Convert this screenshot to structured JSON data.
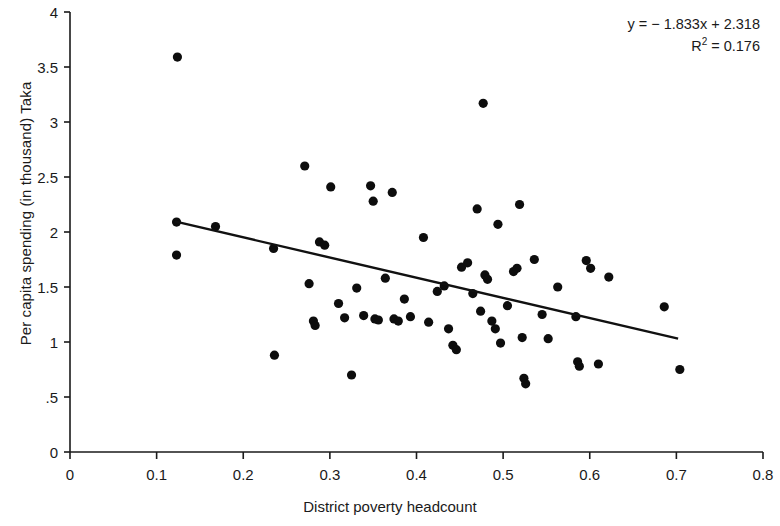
{
  "figure": {
    "background_color": "#ffffff",
    "foreground_color": "#1a1a1a",
    "marker_color": "#0d0d0d",
    "line_color": "#111111"
  },
  "annotation": {
    "equation_prefix": "y = − 1.833x + 2.318",
    "r_squared_label": "R",
    "r_squared_sup": "2",
    "r_squared_value": " = 0.176"
  },
  "chart_data": {
    "type": "scatter",
    "title": "",
    "xlabel": "District poverty headcount",
    "ylabel": "Per capita spending (in thousand) Taka",
    "xlim": [
      0,
      0.8
    ],
    "ylim": [
      0,
      4
    ],
    "grid": false,
    "legend": null,
    "xticks": [
      0,
      0.1,
      0.2,
      0.3,
      0.4,
      0.5,
      0.6,
      0.7,
      0.8
    ],
    "xtick_labels": [
      "0",
      "0.1",
      "0.2",
      "0.3",
      "0.4",
      "0.5",
      "0.6",
      "0.7",
      "0.8"
    ],
    "yticks": [
      0,
      0.5,
      1,
      1.5,
      2,
      2.5,
      3,
      3.5,
      4
    ],
    "ytick_labels": [
      "0",
      ".5",
      "1",
      "1.5",
      "2",
      "2.5",
      "3",
      "3.5",
      "4"
    ],
    "annotations": [
      "y = − 1.833x + 2.318",
      "R² = 0.176"
    ],
    "trendline": {
      "type": "linear",
      "slope": -1.833,
      "intercept": 2.318,
      "r_squared": 0.176,
      "x_start": 0.121,
      "x_end": 0.702,
      "y_start": 2.096,
      "y_end": 1.031
    },
    "points": [
      {
        "x": 0.124,
        "y": 3.59
      },
      {
        "x": 0.123,
        "y": 2.09
      },
      {
        "x": 0.123,
        "y": 1.79
      },
      {
        "x": 0.168,
        "y": 2.05
      },
      {
        "x": 0.235,
        "y": 1.85
      },
      {
        "x": 0.236,
        "y": 0.88
      },
      {
        "x": 0.271,
        "y": 2.6
      },
      {
        "x": 0.276,
        "y": 1.53
      },
      {
        "x": 0.281,
        "y": 1.19
      },
      {
        "x": 0.283,
        "y": 1.15
      },
      {
        "x": 0.288,
        "y": 1.91
      },
      {
        "x": 0.294,
        "y": 1.88
      },
      {
        "x": 0.301,
        "y": 2.41
      },
      {
        "x": 0.31,
        "y": 1.35
      },
      {
        "x": 0.317,
        "y": 1.22
      },
      {
        "x": 0.325,
        "y": 0.7
      },
      {
        "x": 0.331,
        "y": 1.49
      },
      {
        "x": 0.339,
        "y": 1.24
      },
      {
        "x": 0.347,
        "y": 2.42
      },
      {
        "x": 0.35,
        "y": 2.28
      },
      {
        "x": 0.352,
        "y": 1.21
      },
      {
        "x": 0.356,
        "y": 1.2
      },
      {
        "x": 0.364,
        "y": 1.58
      },
      {
        "x": 0.372,
        "y": 2.36
      },
      {
        "x": 0.374,
        "y": 1.21
      },
      {
        "x": 0.379,
        "y": 1.19
      },
      {
        "x": 0.386,
        "y": 1.39
      },
      {
        "x": 0.393,
        "y": 1.23
      },
      {
        "x": 0.408,
        "y": 1.95
      },
      {
        "x": 0.414,
        "y": 1.18
      },
      {
        "x": 0.424,
        "y": 1.46
      },
      {
        "x": 0.432,
        "y": 1.51
      },
      {
        "x": 0.437,
        "y": 1.12
      },
      {
        "x": 0.442,
        "y": 0.97
      },
      {
        "x": 0.446,
        "y": 0.93
      },
      {
        "x": 0.452,
        "y": 1.68
      },
      {
        "x": 0.459,
        "y": 1.72
      },
      {
        "x": 0.465,
        "y": 1.44
      },
      {
        "x": 0.47,
        "y": 2.21
      },
      {
        "x": 0.474,
        "y": 1.28
      },
      {
        "x": 0.477,
        "y": 3.17
      },
      {
        "x": 0.479,
        "y": 1.61
      },
      {
        "x": 0.482,
        "y": 1.57
      },
      {
        "x": 0.487,
        "y": 1.19
      },
      {
        "x": 0.491,
        "y": 1.12
      },
      {
        "x": 0.494,
        "y": 2.07
      },
      {
        "x": 0.497,
        "y": 0.99
      },
      {
        "x": 0.505,
        "y": 1.33
      },
      {
        "x": 0.512,
        "y": 1.64
      },
      {
        "x": 0.516,
        "y": 1.67
      },
      {
        "x": 0.519,
        "y": 2.25
      },
      {
        "x": 0.522,
        "y": 1.04
      },
      {
        "x": 0.524,
        "y": 0.67
      },
      {
        "x": 0.526,
        "y": 0.62
      },
      {
        "x": 0.536,
        "y": 1.75
      },
      {
        "x": 0.545,
        "y": 1.25
      },
      {
        "x": 0.552,
        "y": 1.03
      },
      {
        "x": 0.563,
        "y": 1.5
      },
      {
        "x": 0.584,
        "y": 1.23
      },
      {
        "x": 0.586,
        "y": 0.82
      },
      {
        "x": 0.588,
        "y": 0.78
      },
      {
        "x": 0.596,
        "y": 1.74
      },
      {
        "x": 0.601,
        "y": 1.67
      },
      {
        "x": 0.61,
        "y": 0.8
      },
      {
        "x": 0.622,
        "y": 1.59
      },
      {
        "x": 0.686,
        "y": 1.32
      },
      {
        "x": 0.704,
        "y": 0.75
      }
    ]
  }
}
